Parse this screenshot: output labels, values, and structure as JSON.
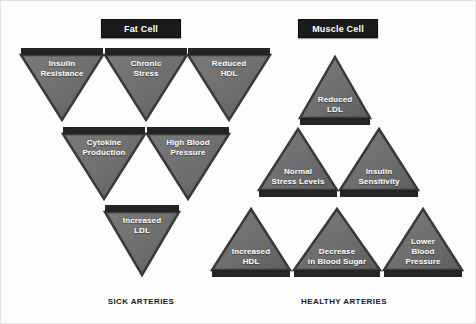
{
  "diagram": {
    "title_left": "Fat Cell",
    "title_right": "Muscle Cell",
    "caption_left": "SICK ARTERIES",
    "caption_right": "HEALTHY ARTERIES",
    "colors": {
      "triangle_fill": "#6e6e6e",
      "triangle_fill_dark": "#5d5d5d",
      "triangle_edge": "#3a3a3a",
      "header_bg": "#1b1b1b",
      "label_text": "#ffffff",
      "caption_text": "#1a1a1a",
      "background": "#fdfdfd"
    }
  },
  "left_panel": {
    "header": "Fat Cell",
    "caption": "SICK ARTERIES",
    "direction": "down",
    "nodes": [
      {
        "label": "Insulin\nResistance",
        "x": 20,
        "y": 47,
        "w": 82,
        "h": 72
      },
      {
        "label": "Chronic\nStress",
        "x": 104,
        "y": 47,
        "w": 82,
        "h": 72
      },
      {
        "label": "Reduced\nHDL",
        "x": 187,
        "y": 47,
        "w": 82,
        "h": 72
      },
      {
        "label": "Cytokine\nProduction",
        "x": 62,
        "y": 126,
        "w": 82,
        "h": 72
      },
      {
        "label": "High Blood\nPressure",
        "x": 146,
        "y": 126,
        "w": 82,
        "h": 72
      },
      {
        "label": "Increased\nLDL",
        "x": 104,
        "y": 204,
        "w": 74,
        "h": 70
      }
    ]
  },
  "right_panel": {
    "header": "Muscle Cell",
    "caption": "HEALTHY ARTERIES",
    "direction": "up",
    "nodes": [
      {
        "label": "Reduced\nLDL",
        "x": 299,
        "y": 56,
        "w": 70,
        "h": 68
      },
      {
        "label": "Normal\nStress Levels",
        "x": 258,
        "y": 128,
        "w": 78,
        "h": 68
      },
      {
        "label": "Insulin\nSensitivity",
        "x": 339,
        "y": 128,
        "w": 78,
        "h": 68
      },
      {
        "label": "Increased\nHDL",
        "x": 211,
        "y": 208,
        "w": 78,
        "h": 68
      },
      {
        "label": "Decrease\nin Blood Sugar",
        "x": 293,
        "y": 208,
        "w": 86,
        "h": 68
      },
      {
        "label": "Lower\nBlood\nPressure",
        "x": 383,
        "y": 208,
        "w": 78,
        "h": 68
      }
    ]
  },
  "headers": {
    "left": {
      "x": 100,
      "y": 18,
      "w": 78,
      "h": 17
    },
    "right": {
      "x": 297,
      "y": 18,
      "w": 78,
      "h": 17
    }
  },
  "captions": {
    "left": {
      "x": 100,
      "y": 296,
      "w": 80
    },
    "right": {
      "x": 288,
      "y": 296,
      "w": 110
    }
  }
}
